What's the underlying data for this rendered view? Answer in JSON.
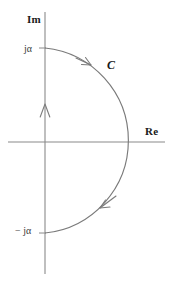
{
  "figure": {
    "type": "complex-plane-contour-diagram",
    "width": 172,
    "height": 288,
    "background_color": "#ffffff",
    "stroke_color": "#6e6e6e",
    "text_color": "#1a1a1a"
  },
  "axes": {
    "imaginary": {
      "label": "Im",
      "orientation": "vertical",
      "arrow_direction": "up",
      "x": 45,
      "y_top": 12,
      "y_bottom": 274
    },
    "real": {
      "label": "Re",
      "orientation": "horizontal",
      "y": 142,
      "x_left": 8,
      "x_right": 165
    }
  },
  "ticks": [
    {
      "label": "jα",
      "axis": "imaginary",
      "x": 45,
      "y": 48
    },
    {
      "label": "− jα",
      "axis": "imaginary",
      "x": 45,
      "y": 233
    }
  ],
  "contour": {
    "label": "C",
    "shape": "semicircle",
    "direction": "clockwise",
    "center": {
      "x": 45,
      "y": 142
    },
    "radius": 93,
    "start_point": {
      "x": 45,
      "y": 48
    },
    "end_point": {
      "x": 45,
      "y": 233
    },
    "rightmost_point": {
      "x": 134,
      "y": 142
    },
    "arrows": [
      {
        "name": "upper-arc-arrow",
        "x": 87,
        "y": 62,
        "angle_deg": 42
      },
      {
        "name": "lower-arc-arrow",
        "x": 104,
        "y": 204,
        "angle_deg": 140
      }
    ]
  }
}
